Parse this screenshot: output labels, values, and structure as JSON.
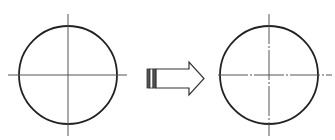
{
  "diagram": {
    "left_figure": {
      "label": "circle-solid-centerlines",
      "cx": 68,
      "cy": 75,
      "r": 49
    },
    "arrow": {
      "direction": "right"
    },
    "right_figure": {
      "label": "circle-dashdot-centerlines",
      "cx": 269,
      "cy": 75,
      "r": 49
    },
    "colors": {
      "stroke": "#222222",
      "centerline": "#555555",
      "background": "#ffffff"
    }
  }
}
